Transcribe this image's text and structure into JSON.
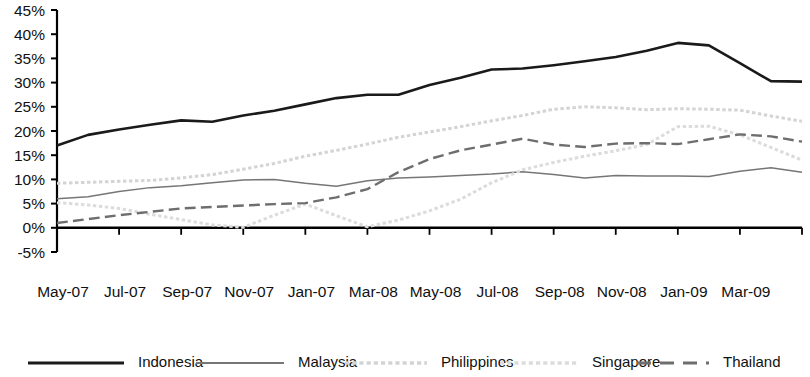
{
  "chart_data": {
    "type": "line",
    "title": "",
    "subtitle": "",
    "xlabel": "",
    "ylabel": "",
    "ylim": [
      -5,
      45
    ],
    "ytick_step": 5,
    "ytick_labels": [
      "45%",
      "40%",
      "35%",
      "30%",
      "25%",
      "20%",
      "15%",
      "10%",
      "5%",
      "0%",
      "-5%"
    ],
    "ytick_values": [
      45,
      40,
      35,
      30,
      25,
      20,
      15,
      10,
      5,
      0,
      -5
    ],
    "grid": false,
    "legend_position": "bottom",
    "x": [
      "May-07",
      "Jun-07",
      "Jul-07",
      "Aug-07",
      "Sep-07",
      "Oct-07",
      "Nov-07",
      "Dec-07",
      "Jan-07",
      "Feb-08",
      "Mar-08",
      "Apr-08",
      "May-08",
      "Jun-08",
      "Jul-08",
      "Aug-08",
      "Sep-08",
      "Oct-08",
      "Nov-08",
      "Dec-08",
      "Jan-09",
      "Feb-09",
      "Mar-09",
      "Apr-09",
      "May-09"
    ],
    "xtick_labels": [
      "May-07",
      "Jul-07",
      "Sep-07",
      "Nov-07",
      "Jan-07",
      "Mar-08",
      "May-08",
      "Jul-08",
      "Sep-08",
      "Nov-08",
      "Jan-09",
      "Mar-09"
    ],
    "xtick_indices": [
      0,
      2,
      4,
      6,
      8,
      10,
      12,
      14,
      16,
      18,
      20,
      22
    ],
    "series": [
      {
        "name": "Indonesia",
        "color": "#1a1a1a",
        "style": "solid",
        "width": 2.6,
        "values": [
          17.0,
          19.2,
          20.3,
          21.3,
          22.2,
          21.9,
          23.2,
          24.2,
          25.5,
          26.8,
          27.5,
          27.5,
          29.5,
          31.0,
          32.7,
          32.9,
          33.6,
          34.4,
          35.3,
          36.6,
          38.2,
          37.7,
          34.0,
          30.3,
          30.2
        ]
      },
      {
        "name": "Malaysia",
        "color": "#767676",
        "style": "solid",
        "width": 1.5,
        "values": [
          6.0,
          6.4,
          7.5,
          8.3,
          8.7,
          9.3,
          9.9,
          10.0,
          9.2,
          8.6,
          9.7,
          10.3,
          10.5,
          10.8,
          11.1,
          11.6,
          11.0,
          10.3,
          10.8,
          10.7,
          10.7,
          10.6,
          11.7,
          12.4,
          11.5
        ]
      },
      {
        "name": "Philippines",
        "color": "#d4d4d4",
        "style": "dotted",
        "width": 3.0,
        "values": [
          9.2,
          9.4,
          9.6,
          9.8,
          10.3,
          11.0,
          12.1,
          13.3,
          14.8,
          16.0,
          17.3,
          18.7,
          19.8,
          20.9,
          22.1,
          23.2,
          24.5,
          25.0,
          24.8,
          24.4,
          24.6,
          24.5,
          24.3,
          23.1,
          22.0
        ]
      },
      {
        "name": "Singapore",
        "color": "#dcdcdc",
        "style": "dotted",
        "width": 3.0,
        "values": [
          5.2,
          4.7,
          4.0,
          2.8,
          1.7,
          0.6,
          0.1,
          2.6,
          4.9,
          2.5,
          0.2,
          1.6,
          3.5,
          5.9,
          9.3,
          12.0,
          13.5,
          14.8,
          15.9,
          17.2,
          20.9,
          21.0,
          19.2,
          16.6,
          14.0
        ]
      },
      {
        "name": "Thailand",
        "color": "#6e6e6e",
        "style": "dashed",
        "width": 2.4,
        "values": [
          1.0,
          1.8,
          2.6,
          3.3,
          4.0,
          4.3,
          4.6,
          4.9,
          5.1,
          6.3,
          8.0,
          11.5,
          14.2,
          16.0,
          17.2,
          18.4,
          17.2,
          16.7,
          17.4,
          17.5,
          17.3,
          18.3,
          19.3,
          18.9,
          17.8
        ]
      }
    ]
  },
  "legend": {
    "items": [
      {
        "label": "Indonesia"
      },
      {
        "label": "Malaysia"
      },
      {
        "label": "Philippines"
      },
      {
        "label": "Singapore"
      },
      {
        "label": "Thailand"
      }
    ]
  }
}
